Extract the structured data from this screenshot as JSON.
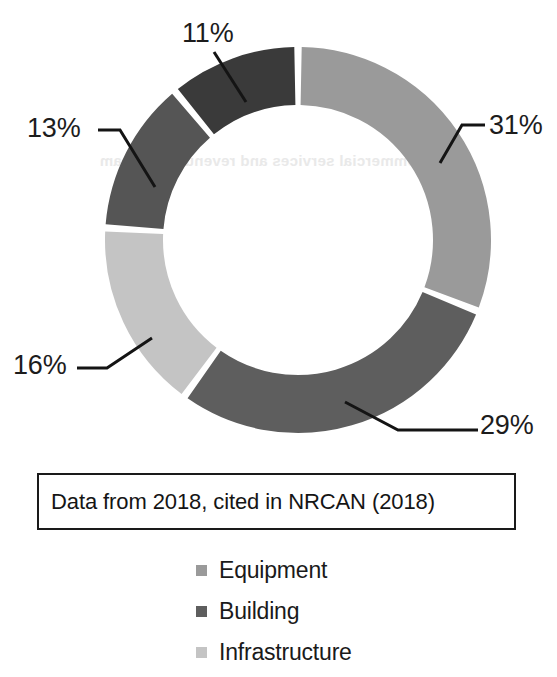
{
  "figure": {
    "ghost_artifact_text": "The commercial services and revenues in steam",
    "caption": "Data from 2018, cited in NRCAN (2018)"
  },
  "colors": {
    "equipment": "#9a9a9a",
    "building_dark": "#5e5e5e",
    "infrastructure": "#c4c4c4",
    "segment_13": "#555555",
    "segment_11": "#3a3a3a",
    "separator": "#ffffff",
    "text": "#1a1a1a",
    "border": "#1a1a1a"
  },
  "legend": {
    "items": [
      {
        "label": "Equipment",
        "color": "#9a9a9a"
      },
      {
        "label": "Building",
        "color": "#5e5e5e"
      },
      {
        "label": "Infrastructure",
        "color": "#c4c4c4"
      }
    ]
  },
  "labels": {
    "pct_11": "11%",
    "pct_31": "31%",
    "pct_13": "13%",
    "pct_16": "16%",
    "pct_29": "29%"
  },
  "chart_data": {
    "type": "pie",
    "variant": "donut",
    "title": "",
    "subtitle": "",
    "caption": "Data from 2018, cited in NRCAN (2018)",
    "units": "percent",
    "total": 100,
    "start_angle_deg": 0,
    "direction": "clockwise",
    "inner_radius_ratio": 0.7,
    "legend": {
      "position": "bottom",
      "entries": [
        "Equipment",
        "Building",
        "Infrastructure"
      ]
    },
    "grid": false,
    "labels": [
      "31%",
      "29%",
      "16%",
      "13%",
      "11%"
    ],
    "values": [
      31,
      29,
      16,
      13,
      11
    ],
    "slices": [
      {
        "label": "31%",
        "value": 31,
        "color": "#9a9a9a",
        "legend_group": "Equipment",
        "start_deg": 0,
        "end_deg": 111.6
      },
      {
        "label": "29%",
        "value": 29,
        "color": "#5e5e5e",
        "legend_group": "Building",
        "start_deg": 111.6,
        "end_deg": 216.0
      },
      {
        "label": "16%",
        "value": 16,
        "color": "#c4c4c4",
        "legend_group": "Infrastructure",
        "start_deg": 216.0,
        "end_deg": 273.6
      },
      {
        "label": "13%",
        "value": 13,
        "color": "#555555",
        "legend_group": "Building",
        "start_deg": 273.6,
        "end_deg": 320.4
      },
      {
        "label": "11%",
        "value": 11,
        "color": "#3a3a3a",
        "legend_group": "Building",
        "start_deg": 320.4,
        "end_deg": 360.0
      }
    ]
  }
}
